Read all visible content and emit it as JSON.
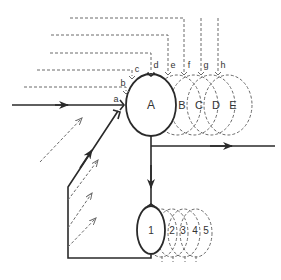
{
  "diagram": {
    "main_node": {
      "label": "A"
    },
    "ghost_nodes": [
      {
        "label": "B"
      },
      {
        "label": "C"
      },
      {
        "label": "D"
      },
      {
        "label": "E"
      }
    ],
    "input_labels": [
      {
        "label": "a"
      },
      {
        "label": "b"
      },
      {
        "label": "c"
      },
      {
        "label": "d"
      },
      {
        "label": "e"
      },
      {
        "label": "f"
      },
      {
        "label": "g"
      },
      {
        "label": "h"
      }
    ],
    "lower_node": {
      "label": "1"
    },
    "lower_ghost_nodes": [
      {
        "label": "2"
      },
      {
        "label": "3"
      },
      {
        "label": "4"
      },
      {
        "label": "5"
      }
    ],
    "colors": {
      "solid_line": "#2a2a2a",
      "dashed_line": "#6a6a6a",
      "background": "#ffffff"
    }
  }
}
